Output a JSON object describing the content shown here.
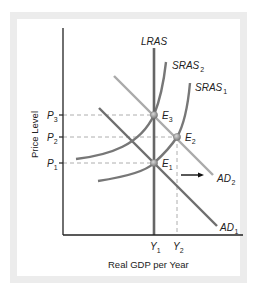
{
  "diagram": {
    "axes": {
      "x_label": "Real GDP per Year",
      "y_label": "Price Level"
    },
    "curves": {
      "lras": {
        "label": "LRAS",
        "color": "#666666"
      },
      "sras2": {
        "label": "SRAS",
        "sub": "2",
        "color": "#777777"
      },
      "sras1": {
        "label": "SRAS",
        "sub": "1",
        "color": "#777777"
      },
      "ad1": {
        "label": "AD",
        "sub": "1",
        "color": "#707070"
      },
      "ad2": {
        "label": "AD",
        "sub": "2",
        "color": "#aaaaaa"
      }
    },
    "price_levels": [
      {
        "label": "P",
        "sub": "3"
      },
      {
        "label": "P",
        "sub": "2"
      },
      {
        "label": "P",
        "sub": "1"
      }
    ],
    "outputs": [
      {
        "label": "Y",
        "sub": "1"
      },
      {
        "label": "Y",
        "sub": "2"
      }
    ],
    "equilibria": [
      {
        "label": "E",
        "sub": "3"
      },
      {
        "label": "E",
        "sub": "2"
      },
      {
        "label": "E",
        "sub": "1"
      }
    ],
    "shift_arrow": "right"
  }
}
